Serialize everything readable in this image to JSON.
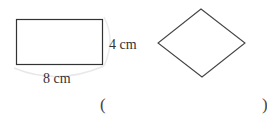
{
  "figure": {
    "rectangle": {
      "width_label": "8 cm",
      "height_label": "4 cm"
    },
    "rhombus": {}
  },
  "answer": {
    "open_paren": "(",
    "close_paren": ")",
    "value": ""
  }
}
